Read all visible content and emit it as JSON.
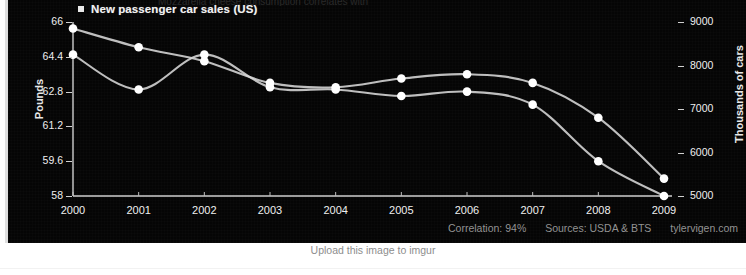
{
  "legend": {
    "marker": "square-marker",
    "label": "New passenger car sales (US)"
  },
  "cropped_title_line": "Mozzarella cheese consumption correlates with",
  "axes": {
    "left_title": "Pounds",
    "right_title": "Thousands of cars",
    "left_ticks": [
      "66",
      "64.4",
      "62.8",
      "61.2",
      "59.6",
      "58"
    ],
    "right_ticks": [
      "9000",
      "8000",
      "7000",
      "6000",
      "5000"
    ],
    "x_ticks": [
      "2000",
      "2001",
      "2002",
      "2003",
      "2004",
      "2005",
      "2006",
      "2007",
      "2008",
      "2009"
    ]
  },
  "footer": {
    "correlation": "Correlation: 94%",
    "sources": "Sources: USDA & BTS",
    "site": "tylervigen.com"
  },
  "caption": {
    "imgur": "Upload this image to imgur"
  },
  "colors": {
    "background": "#050505",
    "line": "#d8d8d8",
    "marker": "#ffffff",
    "text": "#efefef",
    "footer_text": "#9a9a9a",
    "page": "#ffffff"
  },
  "chart_data": {
    "type": "line",
    "title": "",
    "xlabel": "",
    "ylabel": "Pounds",
    "y2label": "Thousands of cars",
    "grid": false,
    "legend_position": "top-left",
    "x": [
      2000,
      2001,
      2002,
      2003,
      2004,
      2005,
      2006,
      2007,
      2008,
      2009
    ],
    "ylim": [
      58,
      66
    ],
    "y2lim": [
      5000,
      9000
    ],
    "series": [
      {
        "name": "Mozzarella cheese consumption",
        "axis": "left",
        "unit": "Pounds",
        "values": [
          64.5,
          62.9,
          64.5,
          63.0,
          62.9,
          62.6,
          62.8,
          62.2,
          59.6,
          58.0
        ]
      },
      {
        "name": "New passenger car sales (US)",
        "axis": "right",
        "unit": "Thousands of cars",
        "values": [
          8850,
          8420,
          8100,
          7600,
          7500,
          7700,
          7800,
          7600,
          6800,
          5400
        ]
      }
    ]
  }
}
